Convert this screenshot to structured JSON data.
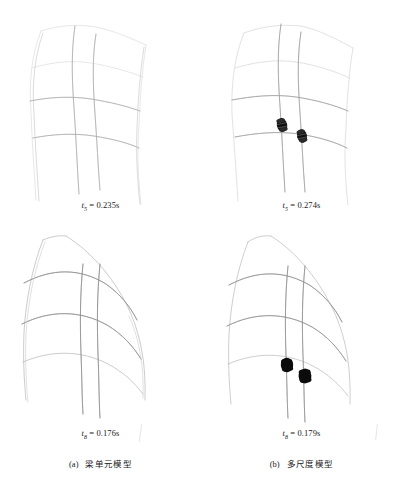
{
  "figure": {
    "panels": [
      {
        "id": "top-left",
        "model": "beam-element",
        "time_label_prefix": "t",
        "time_label_subscript": "5",
        "time_label_value": "= 0.235s",
        "time_label_text": "t5 = 0.235s",
        "has_refined_zones": false,
        "refined_zone_count": 0
      },
      {
        "id": "top-right",
        "model": "multi-scale",
        "time_label_prefix": "t",
        "time_label_subscript": "5",
        "time_label_value": "= 0.274s",
        "time_label_text": "t5 = 0.274s",
        "has_refined_zones": true,
        "refined_zone_count": 2
      },
      {
        "id": "bottom-left",
        "model": "beam-element",
        "time_label_prefix": "t",
        "time_label_subscript": "8",
        "time_label_value": "= 0.176s",
        "time_label_text": "t8 = 0.176s",
        "has_refined_zones": false,
        "refined_zone_count": 0
      },
      {
        "id": "bottom-right",
        "model": "multi-scale",
        "time_label_prefix": "t",
        "time_label_subscript": "8",
        "time_label_value": "= 0.179s",
        "time_label_text": "t8 = 0.179s",
        "has_refined_zones": true,
        "refined_zone_count": 2
      }
    ],
    "subcaptions": [
      {
        "marker": "(a)",
        "text": "梁单元模型"
      },
      {
        "marker": "(b)",
        "text": "多尺度模型"
      }
    ],
    "colors": {
      "background": "#ffffff",
      "frame_line_faint": "#d8d8d8",
      "frame_line": "#9a9a9a",
      "frame_line_dark": "#6e6e6e",
      "refined_zone": "#101010",
      "text": "#1a1a1a"
    }
  }
}
